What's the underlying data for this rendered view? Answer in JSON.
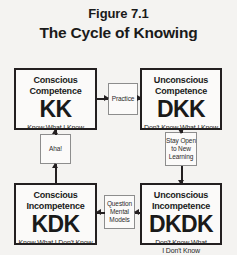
{
  "header": {
    "figure_number": "Figure 7.1",
    "title": "The Cycle of Knowing"
  },
  "quadrants": [
    {
      "id": "kk",
      "title": "Conscious Competence",
      "code": "KK",
      "subtitle": "Know What I Know"
    },
    {
      "id": "dkk",
      "title": "Unconscious Competence",
      "code": "DKK",
      "subtitle": "Don't Know What I Know"
    },
    {
      "id": "kdk",
      "title": "Conscious Incompetence",
      "code": "KDK",
      "subtitle": "Know What I Don't Know"
    },
    {
      "id": "dkdk",
      "title": "Unconscious Incompetence",
      "code": "DKDK",
      "subtitle_line1": "Don't Know What",
      "subtitle_line2": "I Don't Know"
    }
  ],
  "connectors": [
    {
      "id": "practice",
      "label": "Practice",
      "from": "kk",
      "to": "dkk",
      "direction": "right"
    },
    {
      "id": "stay-open",
      "label_line1": "Stay Open",
      "label_line2": "to New",
      "label_line3": "Learning",
      "from": "dkk",
      "to": "dkdk",
      "direction": "down"
    },
    {
      "id": "question-mental-models",
      "label_line1": "Question",
      "label_line2": "Mental",
      "label_line3": "Models",
      "from": "dkdk",
      "to": "kdk",
      "direction": "left"
    },
    {
      "id": "aha",
      "label": "Aha!",
      "from": "kdk",
      "to": "kk",
      "direction": "up"
    }
  ],
  "colors": {
    "background": "#f4f3f1",
    "box_fill": "#fbfaf9",
    "box_border": "#231f20",
    "connector_border": "#8d8d8d",
    "text": "#1a1a1a"
  }
}
